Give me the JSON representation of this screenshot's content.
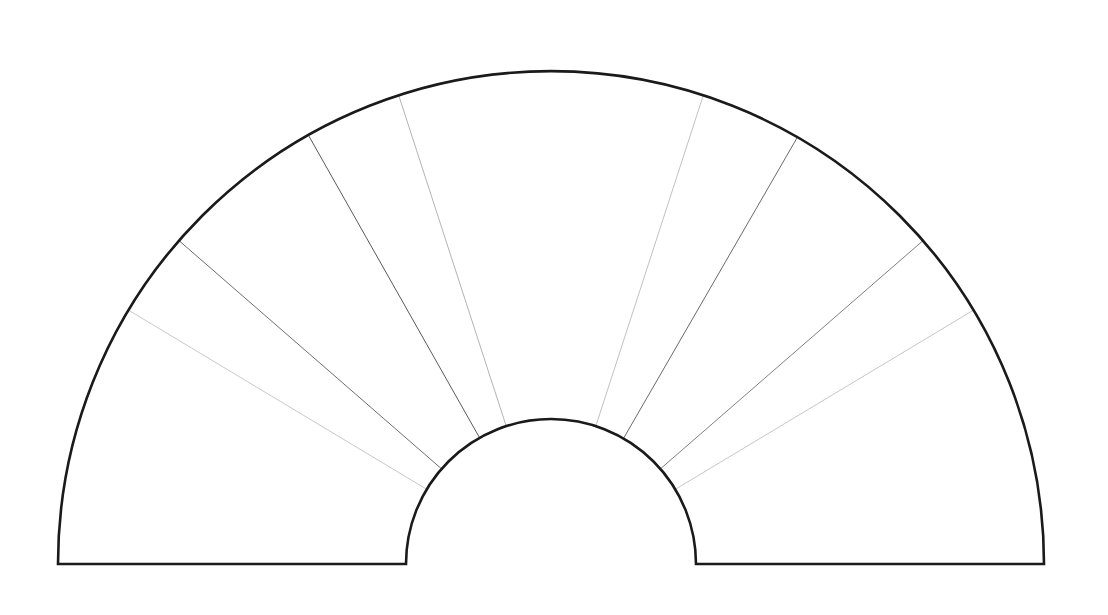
{
  "canvas": {
    "width": 1108,
    "height": 615,
    "background_color": "#ffffff"
  },
  "figure": {
    "name": "semicircular-annulus-fan-diagram",
    "geometry": {
      "center_x": 551,
      "center_y": 564,
      "inner_radius": 145,
      "outer_radius": 493,
      "start_angle_deg": 0,
      "end_angle_deg": 180
    },
    "outline": {
      "stroke_color": "#1a1a1a",
      "stroke_width": 2.6,
      "fill_color": "none"
    },
    "dividers": [
      {
        "id": "divider-1",
        "angle_deg": 149.0,
        "stroke_color": "#c9c9c9",
        "stroke_width": 1.0
      },
      {
        "id": "divider-2",
        "angle_deg": 139.0,
        "stroke_color": "#6e6e6e",
        "stroke_width": 1.0
      },
      {
        "id": "divider-3",
        "angle_deg": 119.5,
        "stroke_color": "#5a5a5a",
        "stroke_width": 1.0
      },
      {
        "id": "divider-4",
        "angle_deg": 108.0,
        "stroke_color": "#b4b4b4",
        "stroke_width": 1.0
      },
      {
        "id": "divider-5",
        "angle_deg": 72.0,
        "stroke_color": "#c2c2c2",
        "stroke_width": 1.0
      },
      {
        "id": "divider-6",
        "angle_deg": 60.0,
        "stroke_color": "#6a6a6a",
        "stroke_width": 1.0
      },
      {
        "id": "divider-7",
        "angle_deg": 41.0,
        "stroke_color": "#808080",
        "stroke_width": 1.0
      },
      {
        "id": "divider-8",
        "angle_deg": 31.0,
        "stroke_color": "#c6c6c6",
        "stroke_width": 1.0
      }
    ]
  },
  "chart_data": {
    "type": "pie",
    "title": "",
    "subtitle": "",
    "xlabel": "",
    "ylabel": "",
    "legend": [],
    "annotations": [],
    "grid": false,
    "shape": "semicircular annulus (half donut) outline",
    "total_sweep_deg": 180,
    "inner_radius_px": 145,
    "outer_radius_px": 493,
    "divider_angles_deg": [
      31.0,
      41.0,
      60.0,
      72.0,
      108.0,
      119.5,
      139.0,
      149.0
    ],
    "sector_boundaries_deg": [
      0,
      31.0,
      41.0,
      60.0,
      72.0,
      108.0,
      119.5,
      139.0,
      149.0,
      180
    ],
    "categories": [
      "sector-1",
      "sector-2",
      "sector-3",
      "sector-4",
      "sector-5",
      "sector-6",
      "sector-7",
      "sector-8",
      "sector-9"
    ],
    "values": [
      31.0,
      10.0,
      19.0,
      12.0,
      36.0,
      11.5,
      19.5,
      10.0,
      31.0
    ],
    "value_units": "degrees of arc",
    "ylim": [
      0,
      180
    ]
  }
}
